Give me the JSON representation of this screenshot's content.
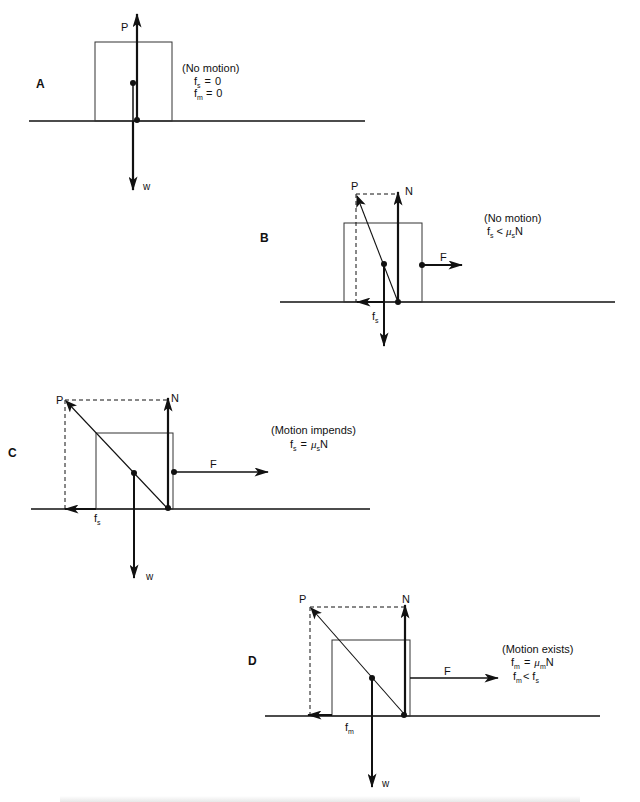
{
  "figure": {
    "panels": [
      {
        "id": "A",
        "label": "A",
        "state": "(No motion)",
        "eq1": {
          "lhs": "f",
          "lhs_sub": "s",
          "op": "=",
          "rhs": "0"
        },
        "eq2": {
          "lhs": "f",
          "lhs_sub": "m",
          "op": "=",
          "rhs": "0"
        },
        "vectors": {
          "P": "P",
          "w": "w"
        }
      },
      {
        "id": "B",
        "label": "B",
        "state": "(No motion)",
        "eq1": {
          "lhs": "f",
          "lhs_sub": "s",
          "op": "<",
          "mu": "μ",
          "mu_sub": "s",
          "rhs": "N"
        },
        "vectors": {
          "P": "P",
          "N": "N",
          "F": "F",
          "fs": "f",
          "fs_sub": "s"
        }
      },
      {
        "id": "C",
        "label": "C",
        "state": "(Motion impends)",
        "eq1": {
          "lhs": "f",
          "lhs_sub": "s",
          "op": "=",
          "mu": "μ",
          "mu_sub": "s",
          "rhs": "N"
        },
        "vectors": {
          "P": "P",
          "N": "N",
          "F": "F",
          "fs": "f",
          "fs_sub": "s",
          "w": "w"
        }
      },
      {
        "id": "D",
        "label": "D",
        "state": "(Motion exists)",
        "eq1": {
          "lhs": "f",
          "lhs_sub": "m",
          "op": "=",
          "mu": "μ",
          "mu_sub": "m",
          "rhs": "N"
        },
        "eq2": {
          "lhs": "f",
          "lhs_sub": "m",
          "op": "<",
          "rhs": "f",
          "rhs_sub": "s"
        },
        "vectors": {
          "P": "P",
          "N": "N",
          "F": "F",
          "fm": "f",
          "fm_sub": "m",
          "w": "w"
        }
      }
    ],
    "colors": {
      "ink": "#111111",
      "background": "#ffffff"
    }
  }
}
